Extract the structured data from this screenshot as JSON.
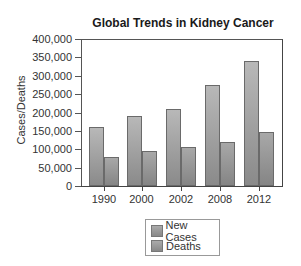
{
  "chart_data": {
    "type": "bar",
    "title": "Global Trends in Kidney Cancer",
    "xlabel": "",
    "ylabel": "Cases/Deaths",
    "ylim": [
      0,
      400000
    ],
    "yticks": [
      0,
      50000,
      100000,
      150000,
      200000,
      250000,
      300000,
      350000,
      400000
    ],
    "ytick_labels": [
      "0",
      "50,000",
      "100,000",
      "150,000",
      "200,000",
      "250,000",
      "300,000",
      "350,000",
      "400,000"
    ],
    "categories": [
      "1990",
      "2000",
      "2002",
      "2008",
      "2012"
    ],
    "series": [
      {
        "name": "New Cases",
        "values": [
          160000,
          190000,
          210000,
          275000,
          340000
        ]
      },
      {
        "name": "Deaths",
        "values": [
          80000,
          95000,
          105000,
          120000,
          148000
        ]
      }
    ],
    "grid": false,
    "legend_position": "bottom-center"
  },
  "colors": {
    "new_cases": "#a0a0a0",
    "deaths": "#959595",
    "axis": "#444444"
  }
}
